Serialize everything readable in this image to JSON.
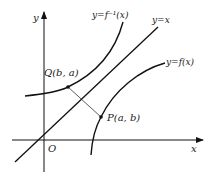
{
  "diagram": {
    "axes": {
      "x_label": "x",
      "y_label": "y",
      "origin_label": "O"
    },
    "curves": {
      "inverse_label": "y=f⁻¹(x)",
      "identity_label": "y=x",
      "function_label": "y=f(x)"
    },
    "points": {
      "Q_label": "Q(b, a)",
      "P_label": "P(a, b)"
    },
    "colors": {
      "stroke": "#111111",
      "text": "#222222",
      "background": "#ffffff"
    }
  }
}
